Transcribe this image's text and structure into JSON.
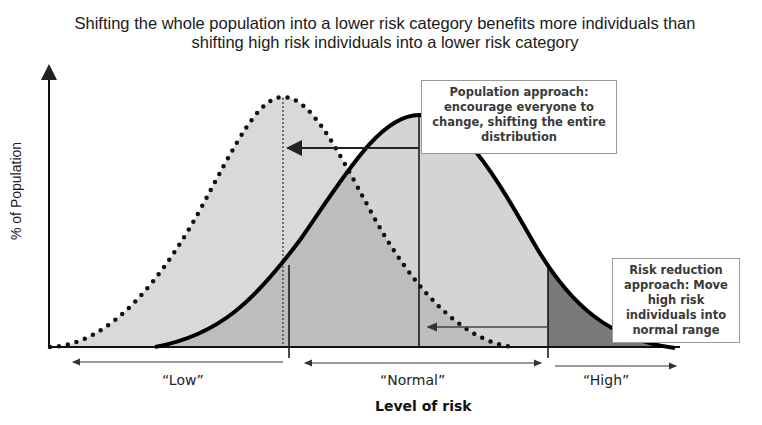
{
  "title": "Shifting the whole population into a lower risk category benefits more individuals than shifting high risk individuals into a lower risk category",
  "axes": {
    "y_label": "% of Population",
    "x_label": "Level of risk"
  },
  "categories": {
    "low": "“Low”",
    "normal": "“Normal”",
    "high": "“High”"
  },
  "annotations": {
    "population_approach": "Population approach: encourage everyone to change, shifting the entire distribution",
    "risk_reduction_approach": "Risk reduction approach: Move high risk individuals into normal range"
  },
  "curves": [
    {
      "name": "shifted-distribution",
      "style": "dotted",
      "peak_x_label": "low/normal boundary"
    },
    {
      "name": "current-distribution",
      "style": "solid",
      "peak_x_label": "normal"
    }
  ],
  "colors": {
    "fill_light": "#d6d6d6",
    "fill_mid": "#b8b8b8",
    "fill_dark": "#7a7a7a",
    "line": "#000000",
    "box_border": "#9a9a9a"
  }
}
